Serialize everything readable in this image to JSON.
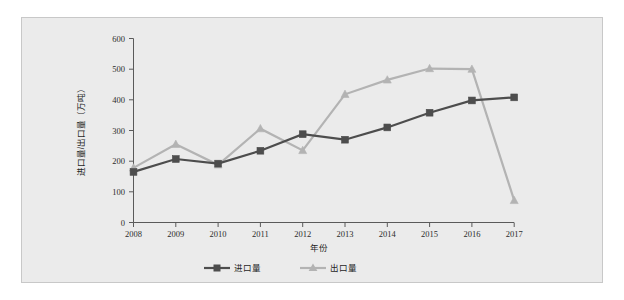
{
  "chart_data": {
    "type": "line",
    "title": "",
    "xlabel": "年份",
    "ylabel": "进口量/出口量（万吨）",
    "categories": [
      "2008",
      "2009",
      "2010",
      "2011",
      "2012",
      "2013",
      "2014",
      "2015",
      "2016",
      "2017"
    ],
    "series": [
      {
        "name": "进口量",
        "marker": "square",
        "color": "#4d4d4d",
        "values": [
          165,
          207,
          192,
          234,
          288,
          270,
          310,
          358,
          398,
          408
        ]
      },
      {
        "name": "出口量",
        "marker": "triangle",
        "color": "#b3b3b3",
        "values": [
          178,
          255,
          188,
          306,
          235,
          418,
          465,
          502,
          500,
          72
        ]
      }
    ],
    "ylim": [
      0,
      600
    ],
    "ytick_values": [
      0,
      100,
      200,
      300,
      400,
      500,
      600
    ],
    "ytick_labels": [
      "0",
      "100",
      "200",
      "300",
      "400",
      "500",
      "600"
    ],
    "grid": false,
    "legend_position": "bottom"
  },
  "axes": {
    "y_title": "进口量/出口量（万吨）",
    "x_title": "年份"
  },
  "legend": {
    "entries": [
      {
        "label": "进口量"
      },
      {
        "label": "出口量"
      }
    ]
  }
}
